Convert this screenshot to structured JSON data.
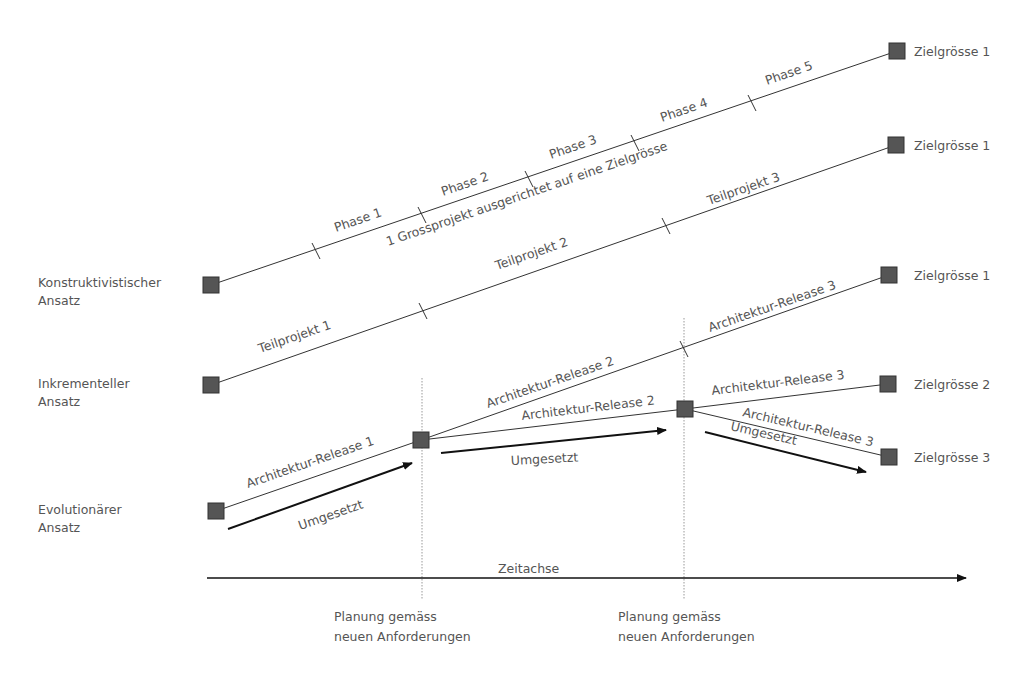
{
  "approaches": [
    {
      "line1": "Konstruktivistischer",
      "line2": "Ansatz"
    },
    {
      "line1": "Inkrementeller",
      "line2": "Ansatz"
    },
    {
      "line1": "Evolutionärer",
      "line2": "Ansatz"
    }
  ],
  "constructivist": {
    "phases": [
      "Phase 1",
      "Phase 2",
      "Phase 3",
      "Phase 4",
      "Phase 5"
    ],
    "caption": "1 Grossprojekt ausgerichtet auf eine Zielgrösse",
    "target": "Zielgrösse 1"
  },
  "incremental": {
    "subprojects": [
      "Teilprojekt 1",
      "Teilprojekt 2",
      "Teilprojekt 3"
    ],
    "target": "Zielgrösse 1"
  },
  "evolutionary": {
    "release1": "Architektur-Release 1",
    "release2_upper": "Architektur-Release 2",
    "release2_lower": "Architektur-Release 2",
    "release3_upper": "Architektur-Release 3",
    "release3_mid": "Architektur-Release 3",
    "release3_lower": "Architektur-Release 3",
    "implemented": [
      "Umgesetzt",
      "Umgesetzt",
      "Umgesetzt"
    ],
    "targets": [
      "Zielgrösse 1",
      "Zielgrösse 2",
      "Zielgrösse 3"
    ]
  },
  "timeline": {
    "label": "Zeitachse",
    "planning": [
      {
        "line1": "Planung gemäss",
        "line2": "neuen Anforderungen"
      },
      {
        "line1": "Planung gemäss",
        "line2": "neuen Anforderungen"
      }
    ]
  },
  "colors": {
    "node": "#555555",
    "line": "#333333",
    "text": "#555555"
  }
}
